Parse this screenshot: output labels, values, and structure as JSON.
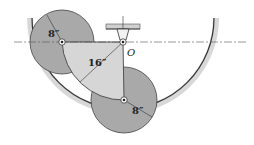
{
  "diagram": {
    "labels": {
      "left_disk_radius": "8″",
      "sector_radius": "16″",
      "lower_disk_radius": "8″",
      "pivot": "O"
    },
    "colors": {
      "disk_fill": "#a9a9a9",
      "sector_fill": "#d4d4d4",
      "bowl_stroke": "#333333",
      "bowl_shadow": "#bdbdbd",
      "support_fill": "#cfcfcf",
      "line": "#333333"
    }
  }
}
